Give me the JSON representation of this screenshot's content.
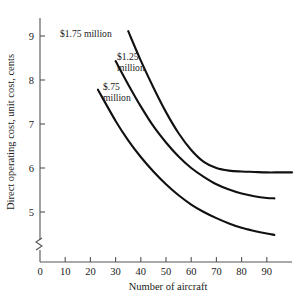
{
  "chart_data": {
    "type": "line",
    "title": "",
    "xlabel": "Number of aircraft",
    "ylabel": "Direct operating cost, unit cost, cents",
    "xlim": [
      0,
      100
    ],
    "ylim": [
      4.2,
      9.3
    ],
    "grid": false,
    "legend_position": "inline-annotations",
    "axis_break": {
      "axis": "y",
      "present": true,
      "note": "zigzag break near origin"
    },
    "xticks": [
      0,
      10,
      20,
      30,
      40,
      50,
      60,
      70,
      80,
      90
    ],
    "xtick_labels": [
      "0",
      "10",
      "20",
      "30",
      "40",
      "50",
      "60",
      "70",
      "80",
      "90"
    ],
    "yticks": [
      5,
      6,
      7,
      8,
      9
    ],
    "ytick_labels": [
      "5",
      "6",
      "7",
      "8",
      "9"
    ],
    "series": [
      {
        "name": "$1.75 million",
        "label": "$1.75 million",
        "label_line1": "$1.75 million",
        "label_line2": "",
        "x": [
          35,
          40,
          45,
          50,
          55,
          60,
          65,
          70,
          75,
          80,
          85,
          90,
          95,
          100
        ],
        "values": [
          9.11,
          8.44,
          7.83,
          7.27,
          6.79,
          6.41,
          6.14,
          6.0,
          5.94,
          5.92,
          5.91,
          5.9,
          5.9,
          5.9
        ]
      },
      {
        "name": "$1.25 million",
        "label": "$1.25 million",
        "label_line1": "$1.25",
        "label_line2": "million",
        "x": [
          30,
          35,
          40,
          45,
          50,
          55,
          60,
          65,
          70,
          75,
          80,
          85,
          90,
          93
        ],
        "values": [
          8.43,
          7.9,
          7.4,
          6.95,
          6.58,
          6.26,
          6.0,
          5.8,
          5.63,
          5.51,
          5.42,
          5.36,
          5.32,
          5.31
        ]
      },
      {
        "name": "$.75 million",
        "label": "$.75 million",
        "label_line1": "$.75",
        "label_line2": "million",
        "x": [
          23,
          30,
          35,
          40,
          45,
          50,
          55,
          60,
          65,
          70,
          75,
          80,
          85,
          90,
          93
        ],
        "values": [
          7.78,
          7.07,
          6.63,
          6.25,
          5.92,
          5.63,
          5.38,
          5.17,
          5.0,
          4.86,
          4.74,
          4.64,
          4.57,
          4.51,
          4.48
        ]
      }
    ],
    "annotations": [
      {
        "text": "$1.75 million",
        "x_px": 60,
        "y_px": 37
      },
      {
        "text": "$1.25",
        "x_px": 117,
        "y_px": 60
      },
      {
        "text": "million",
        "x_px": 117,
        "y_px": 71
      },
      {
        "text": "$.75",
        "x_px": 103,
        "y_px": 90
      },
      {
        "text": "million",
        "x_px": 103,
        "y_px": 101
      }
    ]
  },
  "colors": {
    "curve": "#111111",
    "axis": "#555555",
    "text": "#1a1a1a",
    "background": "#ffffff"
  }
}
